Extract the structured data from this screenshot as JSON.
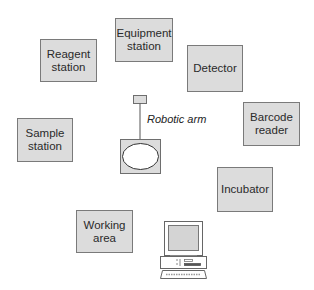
{
  "diagram": {
    "type": "laboratory robot workstation layout",
    "center": {
      "label": "Robotic arm"
    },
    "stations": [
      {
        "id": "reagent",
        "lines": [
          "Reagent",
          "station"
        ],
        "x": 40,
        "y": 39,
        "w": 57,
        "h": 43
      },
      {
        "id": "equipment",
        "lines": [
          "Equipment",
          "station"
        ],
        "x": 115,
        "y": 18,
        "w": 58,
        "h": 44
      },
      {
        "id": "detector",
        "lines": [
          "Detector",
          ""
        ],
        "x": 187,
        "y": 45,
        "w": 56,
        "h": 47
      },
      {
        "id": "barcode",
        "lines": [
          "Barcode",
          "reader"
        ],
        "x": 243,
        "y": 102,
        "w": 57,
        "h": 44
      },
      {
        "id": "sample",
        "lines": [
          "Sample",
          "station"
        ],
        "x": 17,
        "y": 118,
        "w": 56,
        "h": 44
      },
      {
        "id": "incubator",
        "lines": [
          "Incubator",
          ""
        ],
        "x": 217,
        "y": 167,
        "w": 56,
        "h": 45
      },
      {
        "id": "working",
        "lines": [
          "Working",
          "area"
        ],
        "x": 76,
        "y": 210,
        "w": 57,
        "h": 43
      }
    ],
    "computer": {
      "icon": "desktop-computer-icon"
    },
    "colors": {
      "box_fill": "#dcdcdc",
      "box_border": "#7a7a7a",
      "text": "#2a2a2a"
    }
  }
}
